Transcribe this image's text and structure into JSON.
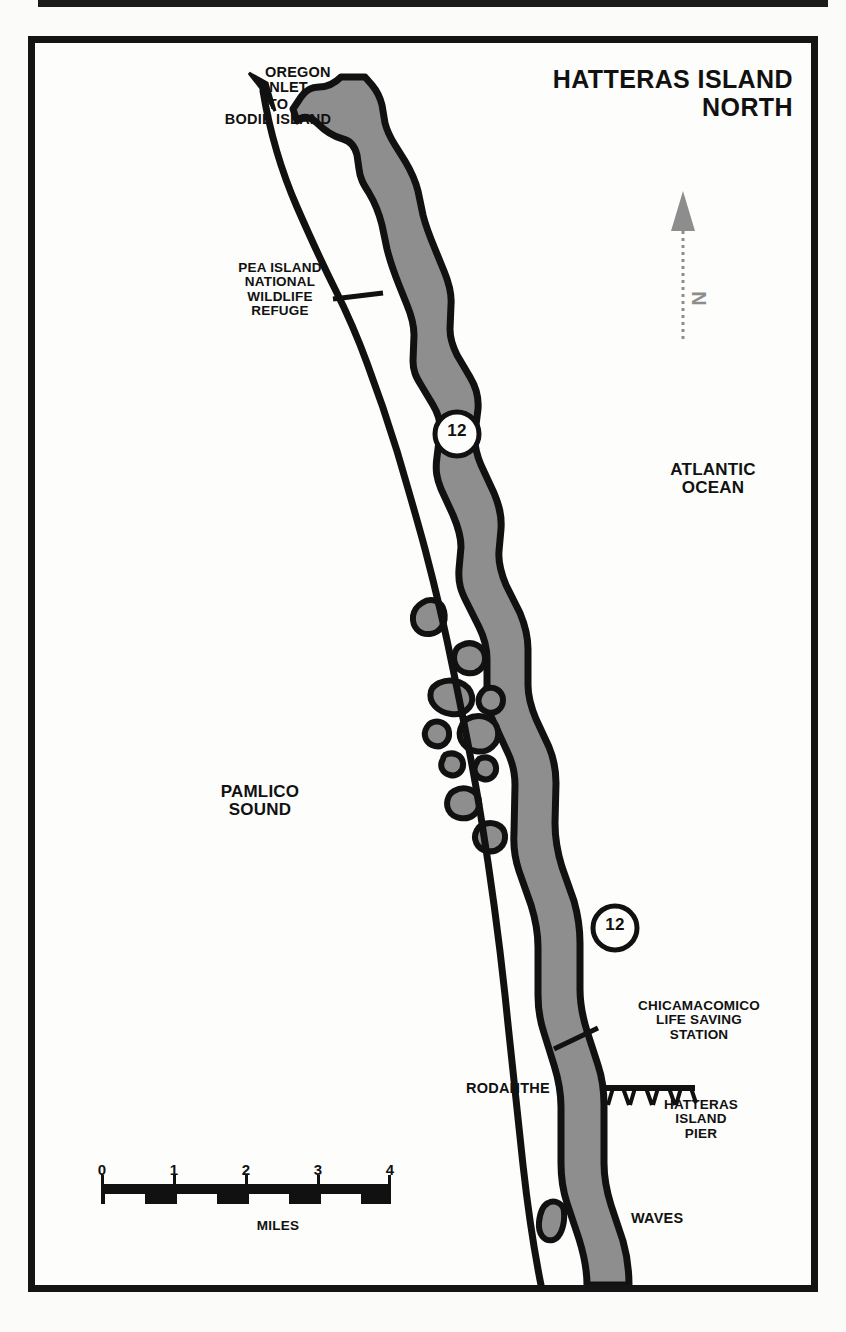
{
  "map": {
    "title": "HATTERAS ISLAND\nNORTH",
    "title_lines": [
      "HATTERAS ISLAND",
      "NORTH"
    ],
    "frame_color": "#141414",
    "land_fill": "#8e8e8e",
    "water_fill": "#fdfdfb",
    "outline_color": "#111111",
    "north_arrow": {
      "letter": "N",
      "color": "#8d8d8d",
      "style": "dashed-line-with-solid-arrowhead"
    },
    "labels": [
      {
        "id": "oregon-inlet",
        "text": "OREGON\nINLET",
        "size": "mid"
      },
      {
        "id": "to-bodie",
        "text": "TO\nBODIE ISLAND",
        "size": "mid"
      },
      {
        "id": "pea-island",
        "text": "PEA ISLAND\nNATIONAL\nWILDLIFE\nREFUGE",
        "size": "sm"
      },
      {
        "id": "atlantic",
        "text": "ATLANTIC\nOCEAN",
        "size": "big"
      },
      {
        "id": "pamlico",
        "text": "PAMLICO\nSOUND",
        "size": "big"
      },
      {
        "id": "chicamacomico",
        "text": "CHICAMACOMICO\nLIFE SAVING\nSTATION",
        "size": "sm"
      },
      {
        "id": "rodanthe",
        "text": "RODANTHE",
        "size": "mid"
      },
      {
        "id": "pier",
        "text": "HATTERAS\nISLAND\nPIER",
        "size": "sm"
      },
      {
        "id": "waves",
        "text": "WAVES",
        "size": "mid"
      },
      {
        "id": "miles",
        "text": "MILES",
        "size": "sm"
      }
    ],
    "route_shields": [
      {
        "id": "shield-upper",
        "number": "12"
      },
      {
        "id": "shield-lower",
        "number": "12"
      }
    ],
    "scale_bar": {
      "unit_label": "MILES",
      "ticks": [
        "0",
        "1",
        "2",
        "3",
        "4"
      ],
      "segments": 4,
      "span_miles": 4
    },
    "symbols": [
      {
        "id": "pier-symbol",
        "name": "fishing-pier-symbol"
      },
      {
        "id": "road-arrow",
        "name": "road-direction-arrow"
      },
      {
        "id": "refuge-leader",
        "name": "leader-line"
      },
      {
        "id": "station-leader",
        "name": "leader-line"
      }
    ]
  }
}
